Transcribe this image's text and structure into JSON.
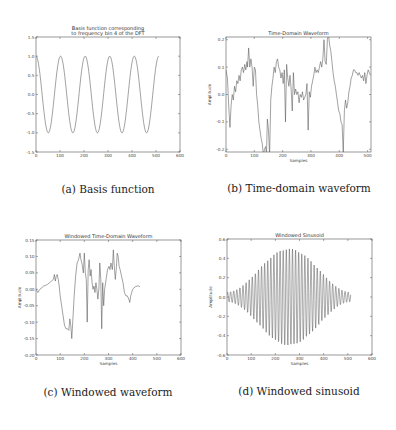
{
  "figure": {
    "captions": {
      "a": "(a) Basis function",
      "b": "(b) Time-domain waveform",
      "c": "(c) Windowed waveform",
      "d": "(d) Windowed sinusoid"
    }
  },
  "chart_data": [
    {
      "id": "a",
      "type": "line",
      "title": "Basis function corresponding\nto frequency bin 4 of the DFT",
      "title_lines": [
        "Basis function corresponding",
        "to frequency bin 4 of the DFT"
      ],
      "xlabel": "",
      "ylabel": "",
      "xlim": [
        0,
        600
      ],
      "ylim": [
        -1.5,
        1.5
      ],
      "xticks": [
        0,
        100,
        200,
        300,
        400,
        500,
        600
      ],
      "yticks": [
        -1.5,
        -1.0,
        -0.5,
        0.0,
        0.5,
        1.0,
        1.5
      ],
      "ytick_labels": [
        "-1.5",
        "-1.0",
        "-0.5",
        "0.0",
        "0.5",
        "1.0",
        "1.5"
      ],
      "grid": false,
      "line_color": "#555555",
      "function": "cos(2*pi*4*n/N)",
      "n_samples": 512,
      "cycles": 5,
      "frame": {
        "left": 36,
        "top": 37,
        "right": 180,
        "bottom": 152
      }
    },
    {
      "id": "b",
      "type": "line",
      "title": "Time-Domain Waveform",
      "title_lines": [
        "Time-Domain Waveform"
      ],
      "xlabel": "Samples",
      "ylabel": "Amplitude",
      "xlim": [
        0,
        512
      ],
      "ylim": [
        -0.21,
        0.21
      ],
      "xticks": [
        0,
        100,
        200,
        300,
        400,
        500
      ],
      "yticks": [
        -0.2,
        -0.1,
        0.0,
        0.1,
        0.2
      ],
      "ytick_labels": [
        "-0.2",
        "-0.1",
        "0.0",
        "0.1",
        "0.2"
      ],
      "grid": false,
      "line_color": "#555555",
      "frame": {
        "left": 226,
        "top": 37,
        "right": 371,
        "bottom": 152
      },
      "points": [
        [
          0,
          0.09
        ],
        [
          5,
          0.06
        ],
        [
          10,
          -0.05
        ],
        [
          14,
          -0.12
        ],
        [
          18,
          -0.04
        ],
        [
          22,
          0.0
        ],
        [
          26,
          -0.02
        ],
        [
          30,
          0.03
        ],
        [
          34,
          0.01
        ],
        [
          38,
          0.05
        ],
        [
          42,
          0.04
        ],
        [
          46,
          0.07
        ],
        [
          50,
          0.05
        ],
        [
          54,
          0.09
        ],
        [
          58,
          0.1
        ],
        [
          62,
          0.08
        ],
        [
          66,
          0.11
        ],
        [
          70,
          0.09
        ],
        [
          74,
          0.12
        ],
        [
          76,
          0.1
        ],
        [
          80,
          0.17
        ],
        [
          84,
          0.1
        ],
        [
          88,
          0.13
        ],
        [
          92,
          0.1
        ],
        [
          96,
          0.03
        ],
        [
          100,
          0.1
        ],
        [
          104,
          0.09
        ],
        [
          108,
          0.0
        ],
        [
          112,
          -0.04
        ],
        [
          116,
          -0.1
        ],
        [
          120,
          -0.13
        ],
        [
          124,
          -0.16
        ],
        [
          128,
          -0.18
        ],
        [
          132,
          -0.22
        ],
        [
          136,
          -0.2
        ],
        [
          140,
          -0.19
        ],
        [
          143,
          -0.22
        ],
        [
          146,
          -0.09
        ],
        [
          150,
          -0.13
        ],
        [
          154,
          -0.22
        ],
        [
          158,
          -0.02
        ],
        [
          162,
          0.03
        ],
        [
          166,
          0.06
        ],
        [
          170,
          0.1
        ],
        [
          174,
          0.08
        ],
        [
          178,
          0.12
        ],
        [
          182,
          0.13
        ],
        [
          186,
          0.1
        ],
        [
          190,
          0.09
        ],
        [
          194,
          0.06
        ],
        [
          198,
          0.08
        ],
        [
          202,
          0.04
        ],
        [
          206,
          0.09
        ],
        [
          210,
          -0.1
        ],
        [
          214,
          0.11
        ],
        [
          218,
          0.06
        ],
        [
          222,
          0.03
        ],
        [
          226,
          0.07
        ],
        [
          230,
          0.02
        ],
        [
          234,
          -0.06
        ],
        [
          238,
          0.08
        ],
        [
          242,
          0.0
        ],
        [
          246,
          0.02
        ],
        [
          250,
          0.0
        ],
        [
          254,
          0.01
        ],
        [
          258,
          -0.03
        ],
        [
          262,
          0.0
        ],
        [
          266,
          -0.01
        ],
        [
          270,
          0.01
        ],
        [
          274,
          -0.02
        ],
        [
          278,
          -0.01
        ],
        [
          282,
          0.0
        ],
        [
          286,
          0.04
        ],
        [
          290,
          -0.13
        ],
        [
          294,
          0.01
        ],
        [
          298,
          -0.01
        ],
        [
          302,
          0.03
        ],
        [
          306,
          0.05
        ],
        [
          310,
          0.07
        ],
        [
          314,
          0.1
        ],
        [
          318,
          0.08
        ],
        [
          322,
          0.09
        ],
        [
          326,
          0.08
        ],
        [
          330,
          0.1
        ],
        [
          334,
          0.12
        ],
        [
          338,
          0.1
        ],
        [
          342,
          0.13
        ],
        [
          346,
          0.2
        ],
        [
          350,
          0.12
        ],
        [
          354,
          0.11
        ],
        [
          358,
          0.2
        ],
        [
          362,
          0.22
        ],
        [
          366,
          0.18
        ],
        [
          370,
          0.16
        ],
        [
          374,
          0.12
        ],
        [
          378,
          0.08
        ],
        [
          382,
          0.05
        ],
        [
          386,
          0.03
        ],
        [
          390,
          0.0
        ],
        [
          394,
          -0.03
        ],
        [
          398,
          -0.06
        ],
        [
          402,
          -0.07
        ],
        [
          406,
          -0.1
        ],
        [
          410,
          -0.11
        ],
        [
          414,
          -0.21
        ],
        [
          418,
          -0.06
        ],
        [
          422,
          -0.02
        ],
        [
          426,
          -0.05
        ],
        [
          430,
          -0.03
        ],
        [
          434,
          0.01
        ],
        [
          438,
          0.03
        ],
        [
          442,
          0.06
        ],
        [
          446,
          0.07
        ],
        [
          450,
          0.09
        ],
        [
          454,
          0.09
        ],
        [
          458,
          0.08
        ],
        [
          462,
          0.08
        ],
        [
          466,
          0.07
        ],
        [
          470,
          0.08
        ],
        [
          474,
          0.07
        ],
        [
          478,
          0.06
        ],
        [
          482,
          0.07
        ],
        [
          486,
          0.05
        ],
        [
          490,
          0.08
        ],
        [
          494,
          0.04
        ],
        [
          498,
          0.07
        ],
        [
          502,
          0.09
        ],
        [
          506,
          0.08
        ],
        [
          510,
          0.07
        ]
      ]
    },
    {
      "id": "c",
      "type": "line",
      "title": "Windowed Time-Domain Waveform",
      "title_lines": [
        "Windowed Time-Domain Waveform"
      ],
      "xlabel": "Samples",
      "ylabel": "Amplitude",
      "xlim": [
        0,
        600
      ],
      "ylim": [
        -0.2,
        0.15
      ],
      "xticks": [
        0,
        100,
        200,
        300,
        400,
        500,
        600
      ],
      "yticks": [
        -0.2,
        -0.15,
        -0.1,
        -0.05,
        0.0,
        0.05,
        0.1,
        0.15
      ],
      "ytick_labels": [
        "-0.20",
        "-0.15",
        "-0.10",
        "-0.05",
        "0.00",
        "0.05",
        "0.10",
        "0.15"
      ],
      "grid": false,
      "line_color": "#555555",
      "frame": {
        "left": 36,
        "top": 240,
        "right": 181,
        "bottom": 355
      },
      "points": [
        [
          0,
          0.0
        ],
        [
          8,
          -0.01
        ],
        [
          16,
          0.0
        ],
        [
          24,
          0.005
        ],
        [
          32,
          0.01
        ],
        [
          40,
          0.012
        ],
        [
          48,
          0.015
        ],
        [
          56,
          0.02
        ],
        [
          64,
          0.025
        ],
        [
          72,
          0.03
        ],
        [
          76,
          0.045
        ],
        [
          80,
          0.025
        ],
        [
          84,
          0.04
        ],
        [
          88,
          0.045
        ],
        [
          92,
          0.03
        ],
        [
          96,
          0.01
        ],
        [
          100,
          -0.02
        ],
        [
          106,
          -0.05
        ],
        [
          112,
          -0.08
        ],
        [
          118,
          -0.11
        ],
        [
          124,
          -0.12
        ],
        [
          130,
          -0.12
        ],
        [
          136,
          -0.125
        ],
        [
          140,
          -0.09
        ],
        [
          144,
          -0.11
        ],
        [
          148,
          -0.15
        ],
        [
          152,
          -0.1
        ],
        [
          158,
          -0.02
        ],
        [
          164,
          0.04
        ],
        [
          170,
          0.08
        ],
        [
          176,
          0.09
        ],
        [
          182,
          0.11
        ],
        [
          186,
          0.09
        ],
        [
          190,
          0.08
        ],
        [
          196,
          0.05
        ],
        [
          200,
          0.11
        ],
        [
          204,
          0.05
        ],
        [
          208,
          0.03
        ],
        [
          212,
          -0.1
        ],
        [
          216,
          0.06
        ],
        [
          220,
          0.09
        ],
        [
          224,
          0.04
        ],
        [
          228,
          0.06
        ],
        [
          232,
          0.02
        ],
        [
          236,
          0.0
        ],
        [
          240,
          0.01
        ],
        [
          244,
          -0.01
        ],
        [
          248,
          0.02
        ],
        [
          252,
          0.0
        ],
        [
          256,
          -0.03
        ],
        [
          260,
          0.0
        ],
        [
          264,
          0.08
        ],
        [
          268,
          0.03
        ],
        [
          272,
          -0.12
        ],
        [
          276,
          0.02
        ],
        [
          280,
          -0.05
        ],
        [
          284,
          0.0
        ],
        [
          290,
          0.03
        ],
        [
          296,
          0.06
        ],
        [
          302,
          0.07
        ],
        [
          306,
          0.06
        ],
        [
          310,
          0.08
        ],
        [
          316,
          0.06
        ],
        [
          320,
          0.12
        ],
        [
          324,
          0.07
        ],
        [
          328,
          0.03
        ],
        [
          332,
          0.06
        ],
        [
          336,
          0.11
        ],
        [
          340,
          0.1
        ],
        [
          344,
          0.07
        ],
        [
          348,
          0.06
        ],
        [
          354,
          0.04
        ],
        [
          360,
          0.02
        ],
        [
          366,
          -0.01
        ],
        [
          372,
          -0.02
        ],
        [
          378,
          -0.02
        ],
        [
          384,
          -0.03
        ],
        [
          388,
          -0.04
        ],
        [
          392,
          -0.02
        ],
        [
          396,
          -0.01
        ],
        [
          400,
          0.0
        ],
        [
          406,
          0.005
        ],
        [
          412,
          0.008
        ],
        [
          418,
          0.01
        ],
        [
          424,
          0.01
        ],
        [
          430,
          0.008
        ]
      ]
    },
    {
      "id": "d",
      "type": "line",
      "title": "Windowed Sinusoid",
      "title_lines": [
        "Windowed Sinusoid"
      ],
      "xlabel": "Samples",
      "ylabel": "Amplitude",
      "xlim": [
        0,
        600
      ],
      "ylim": [
        -0.6,
        0.6
      ],
      "xticks": [
        0,
        100,
        200,
        300,
        400,
        500,
        600
      ],
      "yticks": [
        -0.6,
        -0.4,
        -0.2,
        0.0,
        0.2,
        0.4,
        0.6
      ],
      "ytick_labels": [
        "-0.6",
        "-0.4",
        "-0.2",
        "0.0",
        "0.2",
        "0.4",
        "0.6"
      ],
      "grid": false,
      "line_color": "#444444",
      "function": "0.5*hann(n)*sin(2*pi*f*n)",
      "n_samples": 512,
      "peak_amplitude": 0.5,
      "edge_amplitude": 0.05,
      "cycles": 40,
      "frame": {
        "left": 227,
        "top": 239,
        "right": 372,
        "bottom": 355
      }
    }
  ]
}
